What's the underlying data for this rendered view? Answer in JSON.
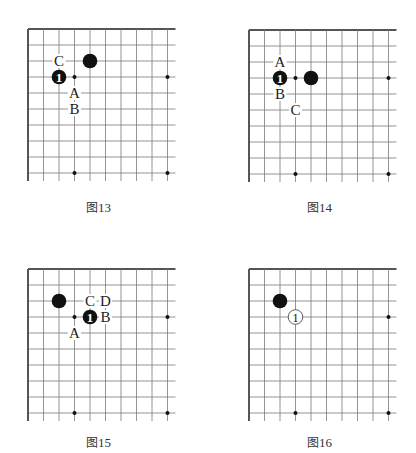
{
  "board_style": {
    "line_color": "#7a7a7a",
    "edge_color": "#555555",
    "stone_black": "#111111",
    "stone_white": "#ffffff",
    "star_color": "#111111",
    "label_color": "#222222"
  },
  "diagrams": [
    {
      "id": "fig13",
      "caption_prefix": "图",
      "caption_number": "13",
      "origin": [
        28,
        29
      ],
      "caption_pos": [
        86,
        198
      ],
      "stones": [
        {
          "col": 4,
          "row": 2,
          "color": "black",
          "label": ""
        },
        {
          "col": 2,
          "row": 3,
          "color": "black",
          "label": "1"
        }
      ],
      "marks": [
        {
          "col": 2,
          "row": 2,
          "text": "C"
        },
        {
          "col": 3,
          "row": 4,
          "text": "A"
        },
        {
          "col": 3,
          "row": 5,
          "text": "B"
        }
      ]
    },
    {
      "id": "fig14",
      "caption_prefix": "图",
      "caption_number": "14",
      "origin": [
        249,
        30
      ],
      "caption_pos": [
        307,
        198
      ],
      "stones": [
        {
          "col": 2,
          "row": 3,
          "color": "black",
          "label": "1"
        },
        {
          "col": 4,
          "row": 3,
          "color": "black",
          "label": ""
        }
      ],
      "marks": [
        {
          "col": 2,
          "row": 2,
          "text": "A"
        },
        {
          "col": 2,
          "row": 4,
          "text": "B"
        },
        {
          "col": 3,
          "row": 5,
          "text": "C"
        }
      ]
    },
    {
      "id": "fig15",
      "caption_prefix": "图",
      "caption_number": "15",
      "origin": [
        28,
        269
      ],
      "caption_pos": [
        86,
        433
      ],
      "stones": [
        {
          "col": 2,
          "row": 2,
          "color": "black",
          "label": ""
        },
        {
          "col": 4,
          "row": 3,
          "color": "black",
          "label": "1"
        }
      ],
      "marks": [
        {
          "col": 4,
          "row": 2,
          "text": "C"
        },
        {
          "col": 5,
          "row": 2,
          "text": "D"
        },
        {
          "col": 5,
          "row": 3,
          "text": "B"
        },
        {
          "col": 3,
          "row": 4,
          "text": "A"
        }
      ]
    },
    {
      "id": "fig16",
      "caption_prefix": "图",
      "caption_number": "16",
      "origin": [
        249,
        269
      ],
      "caption_pos": [
        307,
        433
      ],
      "stones": [
        {
          "col": 2,
          "row": 2,
          "color": "black",
          "label": ""
        },
        {
          "col": 3,
          "row": 3,
          "color": "white",
          "label": "1"
        }
      ],
      "marks": []
    }
  ],
  "grid": {
    "cols": 10,
    "rows": 10,
    "dx": 15.5,
    "dy": 16,
    "overhang_x": 8,
    "overhang_y": 8,
    "star_points": [
      [
        3,
        3
      ],
      [
        9,
        3
      ],
      [
        3,
        9
      ],
      [
        9,
        9
      ]
    ]
  }
}
